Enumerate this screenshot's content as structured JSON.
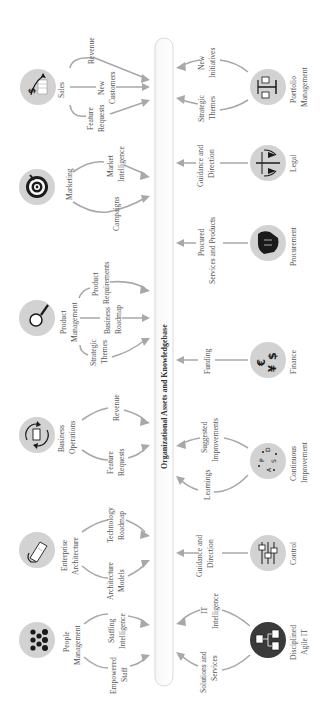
{
  "diagram": {
    "center": {
      "label": "Organizational Assets and Knowledgebase"
    },
    "top_nodes": [
      {
        "id": "sales",
        "label": [
          "Sales"
        ],
        "icon": "sales-chart-dollar-icon",
        "flows": [
          {
            "label": [
              "Revenue"
            ]
          },
          {
            "label": [
              "New",
              "Customers"
            ]
          },
          {
            "label": [
              "Feature",
              "Requests"
            ]
          }
        ]
      },
      {
        "id": "marketing",
        "label": [
          "Marketing"
        ],
        "icon": "target-bullseye-icon",
        "flows": [
          {
            "label": [
              "Market",
              "Intelligence"
            ]
          },
          {
            "label": [
              "Campaigns"
            ]
          }
        ]
      },
      {
        "id": "product-management",
        "label": [
          "Product",
          "Management"
        ],
        "icon": "magnifier-icon",
        "flows": [
          {
            "label": [
              "Product",
              "Requirements"
            ]
          },
          {
            "label": [
              "Business",
              "Roadmap"
            ]
          },
          {
            "label": [
              "Strategic",
              "Themes"
            ]
          }
        ]
      },
      {
        "id": "business-operations",
        "label": [
          "Business",
          "Operations"
        ],
        "icon": "cycle-door-icon",
        "flows": [
          {
            "label": [
              "Revenue"
            ]
          },
          {
            "label": [
              "Feature",
              "Requests"
            ]
          }
        ]
      },
      {
        "id": "enterprise-architecture",
        "label": [
          "Enterprise",
          "Architecture"
        ],
        "icon": "blueprint-hand-icon",
        "flows": [
          {
            "label": [
              "Technology",
              "Roadmap"
            ]
          },
          {
            "label": [
              "Architecture",
              "Models"
            ]
          }
        ]
      },
      {
        "id": "people-management",
        "label": [
          "People",
          "Management"
        ],
        "icon": "people-group-icon",
        "flows": [
          {
            "label": [
              "Staffing",
              "Intelligence"
            ]
          },
          {
            "label": [
              "Empowered",
              "Staff"
            ]
          }
        ]
      }
    ],
    "bottom_nodes": [
      {
        "id": "portfolio-management",
        "label": [
          "Portfolio",
          "Management"
        ],
        "icon": "balance-scale-icon",
        "flows": [
          {
            "label": [
              "New",
              "Initiatives"
            ]
          },
          {
            "label": [
              "Strategic",
              "Themes"
            ]
          }
        ]
      },
      {
        "id": "legal",
        "label": [
          "Legal"
        ],
        "icon": "justice-scales-icon",
        "flows": [
          {
            "label": [
              "Guidance and",
              "Direction"
            ]
          }
        ]
      },
      {
        "id": "procurement",
        "label": [
          "Procurement"
        ],
        "icon": "handshake-icon",
        "flows": [
          {
            "label": [
              "Procured",
              "Services and Products"
            ]
          }
        ]
      },
      {
        "id": "finance",
        "label": [
          "Finance"
        ],
        "icon": "currency-icon",
        "flows": [
          {
            "label": [
              "Funding"
            ]
          }
        ]
      },
      {
        "id": "continuous-improvement",
        "label": [
          "Continuous",
          "Improvement"
        ],
        "icon": "pdsa-cycle-icon",
        "flows": [
          {
            "label": [
              "Suggested",
              "Improvements"
            ]
          },
          {
            "label": [
              "Learnings"
            ]
          }
        ]
      },
      {
        "id": "control",
        "label": [
          "Control"
        ],
        "icon": "sliders-icon",
        "flows": [
          {
            "label": [
              "Guidance and",
              "Direction"
            ]
          }
        ]
      },
      {
        "id": "disciplined-agile-it",
        "label": [
          "Disciplined",
          "Agile IT"
        ],
        "icon": "network-icon",
        "flows": [
          {
            "label": [
              "IT",
              "Intelligence"
            ]
          },
          {
            "label": [
              "Solutions and",
              "Services"
            ]
          }
        ]
      }
    ],
    "icon_glyphs": {
      "finance": [
        "$",
        "€",
        "¥"
      ],
      "pdsa": [
        "P",
        "D",
        "S",
        "A"
      ]
    },
    "colors": {
      "node_fill": "#d2d2d2",
      "dark_node_fill": "#3a3a3a",
      "arrow": "#a8a8a8",
      "text": "#555555",
      "center_border": "#cfcfcf"
    }
  }
}
